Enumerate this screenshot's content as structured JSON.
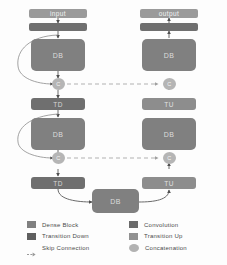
{
  "diagram": {
    "colors": {
      "dense_block": "#808080",
      "transition_down": "#6f6f6f",
      "convolution": "#6f6f6f",
      "transition_up": "#8d8d8d",
      "concatenation": "#b5b5b5",
      "skip_connection": "#a9a9a9",
      "arrow": "#555555",
      "background": "#fdfdfd"
    },
    "endpoints": {
      "input_label": "input",
      "output_label": "output"
    },
    "down_path": [
      {
        "id": "down-conv",
        "label": "",
        "type": "convolution"
      },
      {
        "id": "down-db-1",
        "label": "DB",
        "type": "dense_block"
      },
      {
        "id": "down-concat-1",
        "label": "C",
        "type": "concatenation"
      },
      {
        "id": "down-td-1",
        "label": "TD",
        "type": "transition_down"
      },
      {
        "id": "down-db-2",
        "label": "DB",
        "type": "dense_block"
      },
      {
        "id": "down-concat-2",
        "label": "C",
        "type": "concatenation"
      },
      {
        "id": "down-td-2",
        "label": "TD",
        "type": "transition_down"
      }
    ],
    "bottleneck": {
      "id": "bottleneck-db",
      "label": "DB",
      "type": "dense_block"
    },
    "up_path": [
      {
        "id": "up-tu-1",
        "label": "TU",
        "type": "transition_up"
      },
      {
        "id": "up-concat-1",
        "label": "C",
        "type": "concatenation"
      },
      {
        "id": "up-db-1",
        "label": "DB",
        "type": "dense_block"
      },
      {
        "id": "up-tu-2",
        "label": "TU",
        "type": "transition_up"
      },
      {
        "id": "up-concat-2",
        "label": "C",
        "type": "concatenation"
      },
      {
        "id": "up-db-2",
        "label": "DB",
        "type": "dense_block"
      },
      {
        "id": "up-conv",
        "label": "",
        "type": "convolution"
      }
    ]
  },
  "legend": {
    "left": [
      {
        "label": "Dense Block",
        "icon": "dense-block-swatch",
        "color": "#808080",
        "shape": "square"
      },
      {
        "label": "Transition Down",
        "icon": "transition-down-swatch",
        "color": "#6f6f6f",
        "shape": "square"
      },
      {
        "label": "Skip Connection",
        "icon": "skip-connection-swatch",
        "color": "#9a9a9a",
        "shape": "dashed-arrow"
      }
    ],
    "right": [
      {
        "label": "Convolution",
        "icon": "convolution-swatch",
        "color": "#6a6a6a",
        "shape": "square"
      },
      {
        "label": "Transition Up",
        "icon": "transition-up-swatch",
        "color": "#8d8d8d",
        "shape": "square"
      },
      {
        "label": "Concatenation",
        "icon": "concatenation-swatch",
        "color": "#b5b5b5",
        "shape": "ellipse"
      }
    ]
  }
}
